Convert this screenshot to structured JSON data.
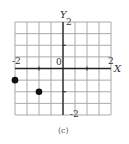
{
  "chart_data": {
    "type": "scatter",
    "title": "",
    "caption": "(c)",
    "xlabel": "X",
    "ylabel": "Y",
    "xlim": [
      -2,
      2
    ],
    "ylim": [
      -2,
      2
    ],
    "grid": true,
    "grid_step": 0.5,
    "tick_labels": {
      "x_min": "-2",
      "x_max": "2",
      "y_max": "2",
      "y_min": "-2",
      "origin": "0"
    },
    "points": [
      {
        "x": -2,
        "y": -0.5
      },
      {
        "x": -1,
        "y": -1
      }
    ]
  },
  "colors": {
    "grid": "#aaaaaa",
    "axis": "#222222",
    "point": "#111111"
  }
}
